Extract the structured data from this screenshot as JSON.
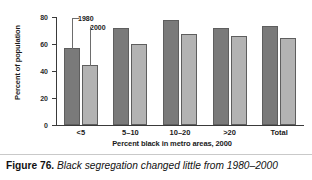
{
  "caption": {
    "figure_number": "Figure 76.",
    "text": "Black segregation changed little from 1980–2000"
  },
  "chart_data": {
    "type": "bar",
    "title": "",
    "subtitle": "",
    "xlabel": "Percent black in metro areas, 2000",
    "ylabel": "Percent of population",
    "categories": [
      "<5",
      "5–10",
      "10–20",
      ">20",
      "Total"
    ],
    "series": [
      {
        "name": "1980",
        "color": "#7a7a7a",
        "values": [
          57,
          72,
          78,
          72,
          73
        ]
      },
      {
        "name": "2000",
        "color": "#b3b3b3",
        "values": [
          44.5,
          60,
          67.5,
          66,
          64.5
        ]
      }
    ],
    "ylim": [
      0,
      80
    ],
    "yticks": [
      0,
      20,
      40,
      60,
      80
    ],
    "ytick_labels": [
      "0",
      "20",
      "40",
      "60",
      "80"
    ],
    "grid": false,
    "legend": "annotations",
    "annotations": [
      {
        "label": "1980",
        "target_series": "1980",
        "target_category": "<5"
      },
      {
        "label": "2000",
        "target_series": "2000",
        "target_category": "<5"
      }
    ]
  }
}
